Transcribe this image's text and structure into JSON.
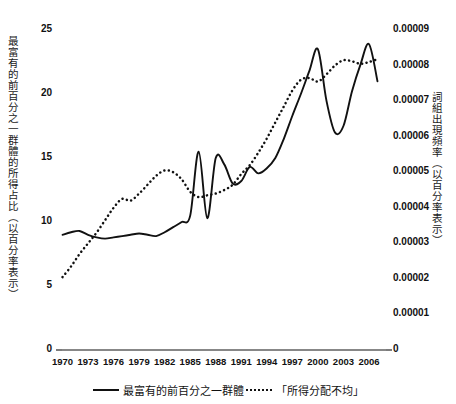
{
  "chart_data": {
    "type": "line",
    "title": "",
    "subtitle": "",
    "xlabel": "",
    "ylabel": "最富有的前百分之一群體的所得占比（以百分率表示）",
    "ylabel_right": "詞組出現頻率（以百分率表示）",
    "grid": false,
    "legend_position": "bottom",
    "xlim": [
      1970,
      2008
    ],
    "ylim": [
      0,
      25
    ],
    "ylim_right": [
      0,
      9e-05
    ],
    "xticks": [
      "1970",
      "1973",
      "1976",
      "1979",
      "1982",
      "1985",
      "1988",
      "1991",
      "1994",
      "1997",
      "2000",
      "2003",
      "2006"
    ],
    "xtick_values": [
      1970,
      1973,
      1976,
      1979,
      1982,
      1985,
      1988,
      1991,
      1994,
      1997,
      2000,
      2003,
      2006
    ],
    "yticks_left": [
      "0",
      "5",
      "10",
      "15",
      "20",
      "25"
    ],
    "ytick_values_left": [
      0,
      5,
      10,
      15,
      20,
      25
    ],
    "yticks_right": [
      "0",
      "0.00001",
      "0.00002",
      "0.00003",
      "0.00004",
      "0.00005",
      "0.00006",
      "0.00007",
      "0.00008",
      "0.00009"
    ],
    "ytick_values_right": [
      0,
      1e-05,
      2e-05,
      3e-05,
      4e-05,
      5e-05,
      6e-05,
      7e-05,
      8e-05,
      9e-05
    ],
    "x": [
      1970,
      1971,
      1972,
      1973,
      1974,
      1975,
      1976,
      1977,
      1978,
      1979,
      1980,
      1981,
      1982,
      1983,
      1984,
      1985,
      1986,
      1987,
      1988,
      1989,
      1990,
      1991,
      1992,
      1993,
      1994,
      1995,
      1996,
      1997,
      1998,
      1999,
      2000,
      2001,
      2002,
      2003,
      2004,
      2005,
      2006,
      2007
    ],
    "series": [
      {
        "name": "最富有的前百分之一群體",
        "axis": "left",
        "style": "solid",
        "color": "#111111",
        "values": [
          9.0,
          9.2,
          9.3,
          9.0,
          8.8,
          8.7,
          8.8,
          8.9,
          9.0,
          9.1,
          9.0,
          8.9,
          9.2,
          9.6,
          10.0,
          10.5,
          15.5,
          10.3,
          15.0,
          14.5,
          13.0,
          13.2,
          14.3,
          13.8,
          14.2,
          15.0,
          16.5,
          18.3,
          20.0,
          21.8,
          23.5,
          19.5,
          17.0,
          17.5,
          20.2,
          22.3,
          23.9,
          21.0
        ]
      },
      {
        "name": "「所得分配不均」",
        "axis": "right",
        "style": "dotted",
        "color": "#111111",
        "values": [
          2.05e-05,
          2.35e-05,
          2.7e-05,
          3e-05,
          3.3e-05,
          3.65e-05,
          4e-05,
          4.25e-05,
          4.2e-05,
          4.4e-05,
          4.65e-05,
          4.9e-05,
          5.05e-05,
          5e-05,
          4.8e-05,
          4.45e-05,
          4.3e-05,
          4.35e-05,
          4.4e-05,
          4.5e-05,
          4.65e-05,
          4.95e-05,
          5.2e-05,
          5.55e-05,
          5.95e-05,
          6.4e-05,
          6.85e-05,
          7.3e-05,
          7.6e-05,
          7.65e-05,
          7.55e-05,
          7.75e-05,
          8e-05,
          8.15e-05,
          8.12e-05,
          8.05e-05,
          8.1e-05,
          8.18e-05
        ]
      }
    ],
    "legend": [
      {
        "label": "最富有的前百分之一群體",
        "style": "solid"
      },
      {
        "label": "「所得分配不均」",
        "style": "dotted"
      }
    ]
  }
}
